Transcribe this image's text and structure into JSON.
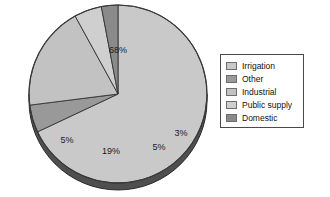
{
  "chart_data": {
    "type": "pie",
    "title": "",
    "subtitle": "",
    "xlabel": "",
    "ylabel": "",
    "grid": false,
    "legend_position": "right",
    "categories": [
      "Irrigation",
      "Other",
      "Industrial",
      "Public supply",
      "Domestic"
    ],
    "values": [
      68,
      5,
      19,
      5,
      3
    ],
    "labels": [
      "68%",
      "5%",
      "19%",
      "5%",
      "3%"
    ],
    "colors": [
      "#c9c9c9",
      "#999999",
      "#c2c2c2",
      "#cfcfcf",
      "#8a8a8a"
    ],
    "annotations": []
  },
  "legend": {
    "items": [
      {
        "label": "Irrigation",
        "color": "#c9c9c9"
      },
      {
        "label": "Other",
        "color": "#999999"
      },
      {
        "label": "Industrial",
        "color": "#c2c2c2"
      },
      {
        "label": "Public supply",
        "color": "#cfcfcf"
      },
      {
        "label": "Domestic",
        "color": "#8a8a8a"
      }
    ]
  },
  "pie_labels": {
    "irrigation": "68%",
    "other": "5%",
    "industrial": "19%",
    "public_supply": "5%",
    "domestic": "3%"
  },
  "style": {
    "edge_color": "#333333",
    "depth_color": "#4f4f4f",
    "background": "#ffffff"
  }
}
